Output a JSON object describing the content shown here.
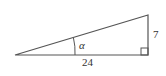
{
  "diagram": {
    "type": "right-triangle",
    "angle_label": "α",
    "side_labels": {
      "adjacent": "24",
      "opposite": "7"
    },
    "right_angle_marker": true,
    "colors": {
      "stroke": "#555555",
      "text": "#333333",
      "background": "#ffffff"
    }
  }
}
